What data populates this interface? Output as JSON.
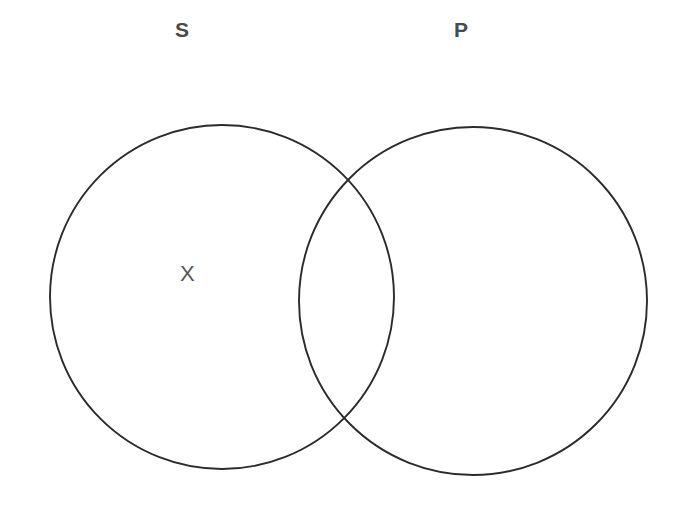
{
  "diagram": {
    "kind": "venn-two-set",
    "proposition": "Some S are not P",
    "background_color": "#ffffff",
    "stroke_color": "#2b2b2b",
    "label_color": "#4a4a4a",
    "mark_color": "#555555",
    "canvas": {
      "width": 686,
      "height": 508
    }
  },
  "labels": {
    "left_set": "S",
    "right_set": "P"
  },
  "circles": {
    "left": {
      "name": "S",
      "cx": 222,
      "cy": 297,
      "r": 172
    },
    "right": {
      "name": "P",
      "cx": 473,
      "cy": 301,
      "r": 174
    }
  },
  "marks": [
    {
      "symbol": "X",
      "region": "S-only",
      "x": 189,
      "y": 275,
      "meaning": "at least one S that is not P"
    }
  ],
  "intersections": {
    "upper": {
      "x": 355,
      "y": 177
    },
    "lower": {
      "x": 348,
      "y": 425
    }
  }
}
